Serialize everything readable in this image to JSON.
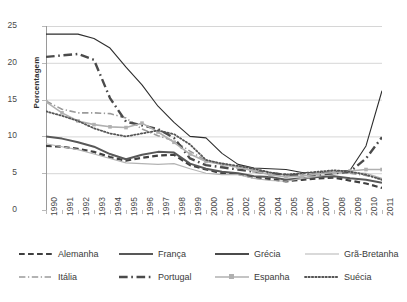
{
  "chart_data": {
    "type": "line",
    "title": "",
    "xlabel": "",
    "ylabel": "Porcentagem",
    "ylim": [
      0,
      25
    ],
    "yticks": [
      0,
      5,
      10,
      15,
      20,
      25
    ],
    "grid": true,
    "legend_position": "bottom",
    "x": [
      1990,
      1991,
      1992,
      1993,
      1994,
      1995,
      1996,
      1997,
      1998,
      1999,
      2000,
      2001,
      2002,
      2003,
      2004,
      2005,
      2006,
      2007,
      2008,
      2009,
      2010,
      2011
    ],
    "categories": [
      "1990",
      "1991",
      "1992",
      "1993",
      "1994",
      "1995",
      "1996",
      "1997",
      "1998",
      "1999",
      "2000",
      "2001",
      "2002",
      "2003",
      "2004",
      "2005",
      "2006",
      "2007",
      "2008",
      "2009",
      "2010",
      "2011"
    ],
    "series": [
      {
        "name": "Alemanha",
        "style": "dashed",
        "color": "#3f3f3f",
        "width": 2.2,
        "values": [
          8.7,
          8.6,
          8.3,
          7.9,
          7.2,
          6.7,
          7.1,
          7.4,
          7.5,
          6.1,
          5.5,
          5.0,
          4.9,
          4.4,
          4.2,
          3.9,
          4.1,
          4.3,
          4.4,
          4.0,
          3.6,
          3.0
        ]
      },
      {
        "name": "França",
        "style": "solid",
        "color": "#585858",
        "width": 2.0,
        "values": [
          10.0,
          9.7,
          9.2,
          8.6,
          7.6,
          6.9,
          7.5,
          7.9,
          7.8,
          6.3,
          5.6,
          5.2,
          5.0,
          4.6,
          4.5,
          4.1,
          4.3,
          4.5,
          4.6,
          4.3,
          4.1,
          3.7
        ]
      },
      {
        "name": "Grécia",
        "style": "solid-thin",
        "color": "#2d2d2d",
        "width": 1.1,
        "values": [
          23.9,
          23.9,
          23.9,
          23.3,
          22.0,
          19.4,
          17.0,
          14.1,
          11.9,
          10.0,
          9.8,
          7.7,
          6.2,
          5.7,
          5.6,
          5.5,
          5.1,
          5.1,
          5.2,
          5.4,
          8.7,
          16.2
        ]
      },
      {
        "name": "Grã-Bretanha",
        "style": "solid-light",
        "color": "#b4b4b4",
        "width": 1.1,
        "values": [
          9.0,
          8.6,
          8.2,
          7.6,
          7.0,
          6.4,
          6.3,
          6.2,
          6.3,
          5.6,
          5.0,
          4.8,
          4.8,
          4.3,
          4.0,
          3.9,
          4.3,
          4.6,
          4.9,
          5.1,
          5.0,
          4.3
        ]
      },
      {
        "name": "Itália",
        "style": "dash-dot-thin",
        "color": "#9a9a9a",
        "width": 1.6,
        "values": [
          14.8,
          13.7,
          13.2,
          13.2,
          13.1,
          12.5,
          11.0,
          10.1,
          9.4,
          8.0,
          6.7,
          6.3,
          5.9,
          5.5,
          5.1,
          4.7,
          4.9,
          5.1,
          5.3,
          5.0,
          4.7,
          4.2
        ]
      },
      {
        "name": "Portugal",
        "style": "dash-dot-thick",
        "color": "#4b4b4b",
        "width": 2.4,
        "values": [
          20.8,
          21.0,
          21.2,
          20.4,
          15.2,
          12.0,
          11.5,
          11.0,
          9.8,
          7.0,
          6.1,
          5.8,
          5.5,
          5.2,
          5.0,
          4.8,
          4.7,
          4.8,
          5.0,
          5.2,
          7.0,
          9.9
        ]
      },
      {
        "name": "Espanha",
        "style": "solid-marker",
        "color": "#b0b0b0",
        "width": 1.6,
        "values": [
          14.7,
          13.2,
          12.1,
          11.6,
          11.3,
          11.2,
          11.8,
          10.6,
          9.2,
          7.6,
          6.6,
          6.2,
          5.8,
          5.3,
          4.8,
          4.5,
          4.6,
          4.9,
          5.1,
          5.3,
          5.5,
          5.5
        ]
      },
      {
        "name": "Suécia",
        "style": "dotted",
        "color": "#555555",
        "width": 1.8,
        "values": [
          13.4,
          12.8,
          12.1,
          11.1,
          10.4,
          10.0,
          10.4,
          10.8,
          10.3,
          8.9,
          6.8,
          6.3,
          6.0,
          5.6,
          5.1,
          4.8,
          5.0,
          5.2,
          5.4,
          5.2,
          4.8,
          4.1
        ]
      }
    ],
    "legend_layout": [
      [
        {
          "name": "Alemanha",
          "style": "dashed",
          "color": "#3f3f3f",
          "width": 2.2
        },
        {
          "name": "França",
          "style": "solid",
          "color": "#585858",
          "width": 2.0
        },
        {
          "name": "Grécia",
          "style": "solid",
          "color": "#4b4b4b",
          "width": 2.0
        },
        {
          "name": "Grã-Bretanha",
          "style": "solid-light",
          "color": "#b4b4b4",
          "width": 1.1
        }
      ],
      [
        {
          "name": "Itália",
          "style": "dash-dot-thin",
          "color": "#9a9a9a",
          "width": 1.6
        },
        {
          "name": "Portugal",
          "style": "dash-dot-thick",
          "color": "#4b4b4b",
          "width": 2.4
        },
        {
          "name": "Espanha",
          "style": "solid-marker",
          "color": "#b0b0b0",
          "width": 1.6
        },
        {
          "name": "Suécia",
          "style": "dotted",
          "color": "#555555",
          "width": 1.8
        }
      ]
    ]
  }
}
